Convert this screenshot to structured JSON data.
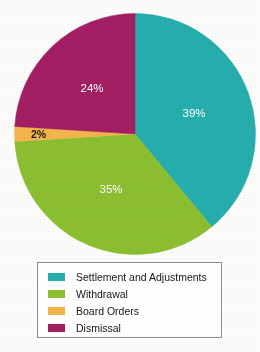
{
  "chart_data": {
    "type": "pie",
    "title": "",
    "categories": [
      "Settlement and Adjustments",
      "Withdrawal",
      "Board Orders",
      "Dismissal"
    ],
    "values": [
      39,
      35,
      2,
      24
    ],
    "value_labels": [
      "39%",
      "35%",
      "2%",
      "24%"
    ],
    "units": "percent",
    "colors": [
      "#26adad",
      "#8cbe31",
      "#f5b44c",
      "#a31e63"
    ],
    "label_text_colors": [
      "#ffffff",
      "#ffffff",
      "#1e1a16",
      "#ffffff"
    ],
    "start_angle_deg": 0,
    "direction": "clockwise",
    "legend_position": "bottom",
    "grid": false
  },
  "pie": {
    "slices": [
      {
        "name": "Settlement and Adjustments",
        "label": "39%",
        "value": 39,
        "color": "#26adad"
      },
      {
        "name": "Withdrawal",
        "label": "35%",
        "value": 35,
        "color": "#8cbe31"
      },
      {
        "name": "Board Orders",
        "label": "2%",
        "value": 2,
        "color": "#f5b44c"
      },
      {
        "name": "Dismissal",
        "label": "24%",
        "value": 24,
        "color": "#a31e63"
      }
    ]
  },
  "legend": {
    "items": [
      {
        "label": "Settlement and Adjustments",
        "color": "#26adad"
      },
      {
        "label": "Withdrawal",
        "color": "#8cbe31"
      },
      {
        "label": "Board Orders",
        "color": "#f5b44c"
      },
      {
        "label": "Dismissal",
        "color": "#a31e63"
      }
    ]
  }
}
